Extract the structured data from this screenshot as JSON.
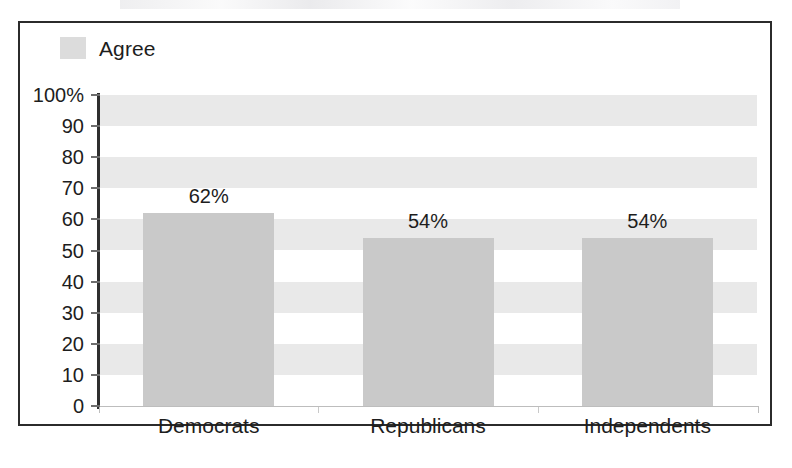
{
  "chart_data": {
    "type": "bar",
    "title": "",
    "xlabel": "",
    "ylabel": "",
    "ylim": [
      0,
      100
    ],
    "grid": true,
    "grid_style": "alternating-horizontal-bands",
    "legend_position": "top-left",
    "categories": [
      "Democrats",
      "Republicans",
      "Independents"
    ],
    "series": [
      {
        "name": "Agree",
        "values": [
          62,
          54,
          54
        ],
        "value_labels": [
          "62%",
          "54%",
          "54%"
        ],
        "color": "#c9c9c9"
      }
    ],
    "ytick_labels": [
      "100%",
      "90",
      "80",
      "70",
      "60",
      "50",
      "40",
      "30",
      "20",
      "10",
      "0"
    ],
    "ytick_values": [
      100,
      90,
      80,
      70,
      60,
      50,
      40,
      30,
      20,
      10,
      0
    ]
  },
  "legend": {
    "entries": [
      {
        "label": "Agree",
        "color": "#c9c9c9"
      }
    ]
  },
  "colors": {
    "bar_fill": "#c9c9c9",
    "band_fill": "#e9e9e9",
    "frame": "#2b2b2b",
    "axis": "#2e2e2e",
    "text": "#1d1d1d"
  }
}
